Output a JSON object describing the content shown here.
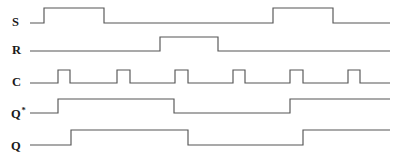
{
  "figure": {
    "kind": "digital-timing-diagram",
    "width": 397,
    "height": 155,
    "background_color": "#ffffff",
    "trace_color": "#555555",
    "label_color": "#1a1a1a",
    "trace_start_x": 30,
    "trace_end_x": 390
  },
  "signals": [
    {
      "id": "S",
      "label": "S",
      "superscript": "",
      "label_x": 12,
      "label_y": 16,
      "low_y": 23,
      "high_y": 8,
      "initial_level": 0,
      "transitions": [
        {
          "x": 44,
          "level": 1
        },
        {
          "x": 104,
          "level": 0
        },
        {
          "x": 273,
          "level": 1
        },
        {
          "x": 333,
          "level": 0
        }
      ]
    },
    {
      "id": "R",
      "label": "R",
      "superscript": "",
      "label_x": 12,
      "label_y": 44,
      "low_y": 51,
      "high_y": 37,
      "initial_level": 0,
      "transitions": [
        {
          "x": 160,
          "level": 1
        },
        {
          "x": 218,
          "level": 0
        }
      ]
    },
    {
      "id": "C",
      "label": "C",
      "superscript": "",
      "label_x": 12,
      "label_y": 76,
      "low_y": 83,
      "high_y": 70,
      "initial_level": 0,
      "transitions": [
        {
          "x": 58,
          "level": 1
        },
        {
          "x": 70,
          "level": 0
        },
        {
          "x": 117,
          "level": 1
        },
        {
          "x": 130,
          "level": 0
        },
        {
          "x": 175,
          "level": 1
        },
        {
          "x": 188,
          "level": 0
        },
        {
          "x": 233,
          "level": 1
        },
        {
          "x": 245,
          "level": 0
        },
        {
          "x": 290,
          "level": 1
        },
        {
          "x": 303,
          "level": 0
        },
        {
          "x": 348,
          "level": 1
        },
        {
          "x": 360,
          "level": 0
        }
      ]
    },
    {
      "id": "Qstar",
      "label": "Q",
      "superscript": "*",
      "label_x": 11,
      "label_y": 108,
      "low_y": 113,
      "high_y": 99,
      "initial_level": 0,
      "transitions": [
        {
          "x": 58,
          "level": 1
        },
        {
          "x": 174,
          "level": 0
        },
        {
          "x": 290,
          "level": 1
        }
      ]
    },
    {
      "id": "Q",
      "label": "Q",
      "superscript": "",
      "label_x": 11,
      "label_y": 140,
      "low_y": 145,
      "high_y": 130,
      "initial_level": 0,
      "transitions": [
        {
          "x": 71,
          "level": 1
        },
        {
          "x": 188,
          "level": 0
        },
        {
          "x": 303,
          "level": 1
        }
      ]
    }
  ],
  "chart_data": {
    "type": "line",
    "title": "",
    "xlabel": "",
    "ylabel": "",
    "subtitle": "",
    "legend": [],
    "grid": false,
    "x_unit": "pixels",
    "x_range": [
      30,
      390
    ],
    "series": [
      {
        "name": "S",
        "type": "digital",
        "initial": 0,
        "edges": [
          [
            44,
            1
          ],
          [
            104,
            0
          ],
          [
            273,
            1
          ],
          [
            333,
            0
          ]
        ],
        "high_intervals": [
          [
            44,
            104
          ],
          [
            273,
            333
          ]
        ]
      },
      {
        "name": "R",
        "type": "digital",
        "initial": 0,
        "edges": [
          [
            160,
            1
          ],
          [
            218,
            0
          ]
        ],
        "high_intervals": [
          [
            160,
            218
          ]
        ]
      },
      {
        "name": "C",
        "type": "digital",
        "initial": 0,
        "edges": [
          [
            58,
            1
          ],
          [
            70,
            0
          ],
          [
            117,
            1
          ],
          [
            130,
            0
          ],
          [
            175,
            1
          ],
          [
            188,
            0
          ],
          [
            233,
            1
          ],
          [
            245,
            0
          ],
          [
            290,
            1
          ],
          [
            303,
            0
          ],
          [
            348,
            1
          ],
          [
            360,
            0
          ]
        ],
        "high_intervals": [
          [
            58,
            70
          ],
          [
            117,
            130
          ],
          [
            175,
            188
          ],
          [
            233,
            245
          ],
          [
            290,
            303
          ],
          [
            348,
            360
          ]
        ],
        "pulse_count": 6
      },
      {
        "name": "Q*",
        "type": "digital",
        "initial": 0,
        "edges": [
          [
            58,
            1
          ],
          [
            174,
            0
          ],
          [
            290,
            1
          ]
        ],
        "high_intervals": [
          [
            58,
            174
          ],
          [
            290,
            390
          ]
        ]
      },
      {
        "name": "Q",
        "type": "digital",
        "initial": 0,
        "edges": [
          [
            71,
            1
          ],
          [
            188,
            0
          ],
          [
            303,
            1
          ]
        ],
        "high_intervals": [
          [
            71,
            188
          ],
          [
            303,
            390
          ]
        ]
      }
    ]
  }
}
